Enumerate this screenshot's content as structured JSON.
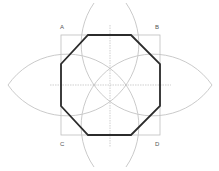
{
  "diagram": {
    "labels": {
      "a": "A",
      "b": "B",
      "c": "C",
      "d": "D"
    },
    "colors": {
      "octagon": "#2b2b2b",
      "square": "#bdbdbd",
      "arcs": "#c4c4c4",
      "axes": "#b0b0b0",
      "label": "#555555",
      "background": "#ffffff"
    },
    "square": {
      "x": 61,
      "y": 35,
      "size": 99
    },
    "center": {
      "x": 110,
      "y": 85
    },
    "octagon_points": "88,35 131,35 160,64 160,106 131,135 88,135 61,106 61,64",
    "arcs": [
      {
        "name": "arc-centered-a",
        "d": "M 8 85 A 71 71 0 1 0 126 3"
      },
      {
        "name": "arc-centered-b",
        "d": "M 212 85 A 71 71 0 1 1 94 3"
      },
      {
        "name": "arc-centered-c",
        "d": "M 8 85 A 71 71 0 1 1 126 167"
      },
      {
        "name": "arc-centered-d",
        "d": "M 212 85 A 71 71 0 1 0 94 167"
      }
    ],
    "axes": {
      "horizontal": {
        "x1": 50,
        "y1": 85,
        "x2": 171,
        "y2": 85
      },
      "vertical": {
        "x1": 110,
        "y1": 25,
        "x2": 110,
        "y2": 147
      }
    }
  }
}
